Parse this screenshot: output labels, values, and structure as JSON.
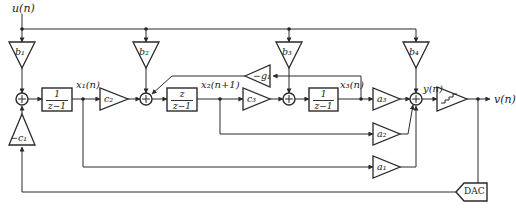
{
  "diagram": {
    "type": "sigma-delta modulator block diagram",
    "signals": {
      "input": "u(n)",
      "output": "v(n)",
      "x1": "x₁(n)",
      "x2": "x₂(n+1)",
      "x3": "x₃(n)",
      "y": "y(n)"
    },
    "input_gains": [
      {
        "id": "b1",
        "label": "b₁"
      },
      {
        "id": "b2",
        "label": "b₂"
      },
      {
        "id": "b3",
        "label": "b₃"
      },
      {
        "id": "b4",
        "label": "b₄"
      }
    ],
    "forward_gains": [
      {
        "id": "c2",
        "label": "c₂"
      },
      {
        "id": "c3",
        "label": "c₃"
      }
    ],
    "feedback_gains": [
      {
        "id": "minus_c1",
        "label": "−c₁"
      },
      {
        "id": "minus_g1",
        "label": "−g₁"
      }
    ],
    "output_gains": [
      {
        "id": "a1",
        "label": "a₁"
      },
      {
        "id": "a2",
        "label": "a₂"
      },
      {
        "id": "a3",
        "label": "a₃"
      }
    ],
    "integrators": [
      {
        "id": "int1",
        "num": "1",
        "den": "z−1"
      },
      {
        "id": "int2",
        "num": "z",
        "den": "z−1"
      },
      {
        "id": "int3",
        "num": "1",
        "den": "z−1"
      }
    ],
    "summers": [
      "+",
      "+",
      "+",
      "+"
    ],
    "quantizer": {
      "label": "quantizer",
      "icon": "staircase-icon"
    },
    "dac": {
      "label": "DAC"
    }
  }
}
